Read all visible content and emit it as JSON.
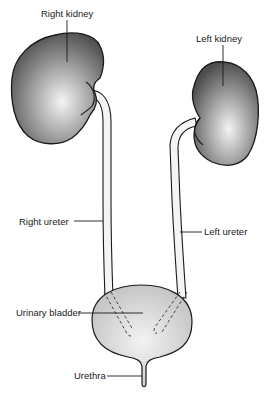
{
  "diagram": {
    "labels": {
      "right_kidney": "Right kidney",
      "left_kidney": "Left kidney",
      "right_ureter": "Right ureter",
      "left_ureter": "Left ureter",
      "urinary_bladder": "Urinary bladder",
      "urethra": "Urethra"
    },
    "colors": {
      "kidney_light": "#f2f2f2",
      "kidney_dark": "#4a4a4a",
      "bladder_light": "#ececec",
      "bladder_dark": "#bdbdbd",
      "outline": "#1a1a1a",
      "ureter_fill": "#f4f4f4",
      "background": "#ffffff"
    }
  }
}
